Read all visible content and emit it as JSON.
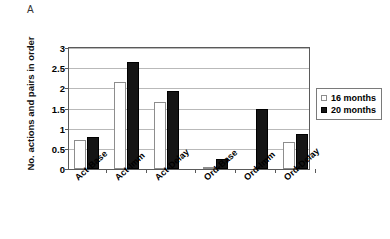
{
  "panel": {
    "letter": "A"
  },
  "legend": {
    "position": "right",
    "entries": [
      {
        "label": "16 months",
        "swatch": "open-square",
        "color": "#ffffff"
      },
      {
        "label": "20 months",
        "swatch": "filled-square",
        "color": "#151515"
      }
    ]
  },
  "chart_data": {
    "type": "bar",
    "title": "",
    "subtitle": "",
    "xlabel": "",
    "ylabel": "No. actions and pairs in order",
    "ylim": [
      0,
      3
    ],
    "yticks": [
      "0",
      "0.5",
      "1",
      "1.5",
      "2",
      "2.5",
      "3"
    ],
    "ytick_values": [
      0,
      0.5,
      1,
      1.5,
      2,
      2.5,
      3
    ],
    "grid": "horizontal",
    "legend_position": "right",
    "categories": [
      "Act-Base",
      "Act-Imm",
      "Act-Delay",
      "Ord-Base",
      "Ord-Imm",
      "Ord-Delay"
    ],
    "series": [
      {
        "name": "16 months",
        "values": [
          0.73,
          2.15,
          1.65,
          0.03,
          0.0,
          0.68
        ]
      },
      {
        "name": "20 months",
        "values": [
          0.8,
          2.65,
          1.93,
          0.25,
          1.5,
          0.88
        ]
      }
    ],
    "annotations": [
      "A"
    ]
  }
}
